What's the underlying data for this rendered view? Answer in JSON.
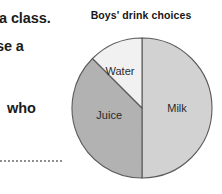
{
  "worksheet": {
    "lines": [
      "a class.",
      "se a",
      "-",
      "who"
    ],
    "answer_line_label": "dotted answer line"
  },
  "chart_data": {
    "type": "pie",
    "title": "Boys' drink choices",
    "subtitle": "",
    "xlabel": "",
    "ylabel": "",
    "grid": false,
    "legend_position": "none",
    "labels_position": "inside-slices",
    "start_angle_deg": 0,
    "direction": "clockwise",
    "categories": [
      "Milk",
      "Juice",
      "Water"
    ],
    "values": [
      50,
      37.5,
      12.5
    ],
    "value_unit": "percent",
    "slices": [
      {
        "label": "Milk",
        "value": 50,
        "color": "#d2d2d2",
        "start_deg": 0,
        "end_deg": 180
      },
      {
        "label": "Juice",
        "value": 37.5,
        "color": "#b2b2b2",
        "start_deg": 180,
        "end_deg": 315
      },
      {
        "label": "Water",
        "value": 12.5,
        "color": "#f1f1f1",
        "start_deg": 315,
        "end_deg": 360
      }
    ],
    "annotations": []
  },
  "style": {
    "outline_color": "#5b5b5b",
    "background": "#ffffff",
    "title_color": "#161616",
    "label_color": "#2a2a2a"
  }
}
